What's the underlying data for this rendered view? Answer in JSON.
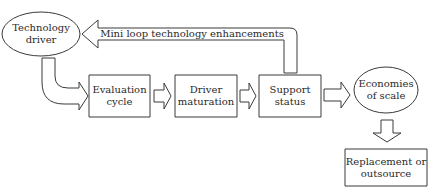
{
  "diagram": {
    "nodes": {
      "technology_driver": {
        "label": "Technology\ndriver",
        "shape": "ellipse"
      },
      "evaluation_cycle": {
        "label": "Evaluation\ncycle",
        "shape": "rectangle"
      },
      "driver_maturation": {
        "label": "Driver\nmaturation",
        "shape": "rectangle"
      },
      "support_status": {
        "label": "Support\nstatus",
        "shape": "rectangle"
      },
      "economies_of_scale": {
        "label": "Economies\nof scale",
        "shape": "ellipse"
      },
      "replacement": {
        "label": "Replacement or\noutsource",
        "shape": "rectangle"
      }
    },
    "edges": [
      {
        "from": "technology_driver",
        "to": "evaluation_cycle",
        "style": "curved-block-arrow"
      },
      {
        "from": "evaluation_cycle",
        "to": "driver_maturation",
        "style": "block-arrow"
      },
      {
        "from": "driver_maturation",
        "to": "support_status",
        "style": "block-arrow"
      },
      {
        "from": "support_status",
        "to": "economies_of_scale",
        "style": "block-arrow"
      },
      {
        "from": "economies_of_scale",
        "to": "replacement",
        "style": "block-arrow-down"
      },
      {
        "from": "support_status",
        "to": "technology_driver",
        "style": "loop-block-arrow",
        "label": "Mini loop technology enhancements"
      }
    ],
    "loop_label": "Mini loop technology enhancements",
    "colors": {
      "stroke": "#3a3a3a",
      "fill": "#ffffff",
      "text": "#2a2a2a"
    }
  }
}
